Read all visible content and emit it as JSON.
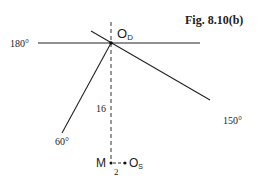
{
  "figure": {
    "title": "Fig. 8.10(b)",
    "labels": {
      "origin_label_main": "O",
      "origin_label_sub": "D",
      "angle_180": "180°",
      "angle_150": "150°",
      "angle_60": "60°",
      "distance_16": "16",
      "point_m": "M",
      "distance_2": "2",
      "os_label_main": "O",
      "os_label_sub": "S"
    },
    "colors": {
      "line": "#222222",
      "background": "#ffffff"
    }
  }
}
